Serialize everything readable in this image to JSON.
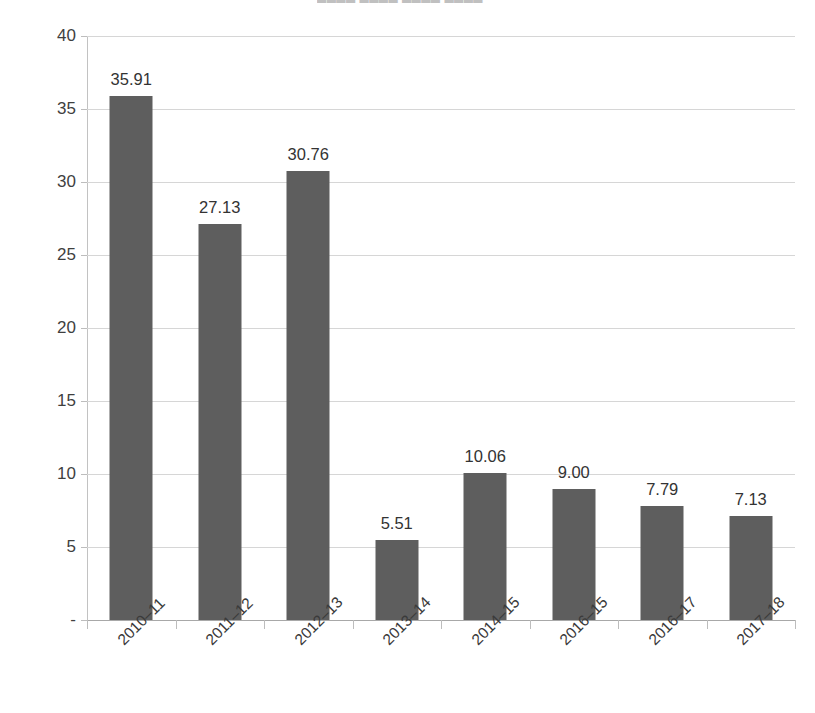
{
  "chart_data": {
    "type": "bar",
    "title": "",
    "xlabel": "",
    "ylabel": "",
    "categories": [
      "2010–11",
      "2011–12",
      "2012–13",
      "2013–14",
      "2014–15",
      "2016–15",
      "2016–17",
      "2017–18"
    ],
    "values": [
      35.91,
      27.13,
      30.76,
      5.51,
      10.06,
      9.0,
      7.79,
      7.13
    ],
    "value_labels": [
      "35.91",
      "27.13",
      "30.76",
      "5.51",
      "10.06",
      "9.00",
      "7.79",
      "7.13"
    ],
    "ylim": [
      0,
      40
    ],
    "ytick_values": [
      0,
      5,
      10,
      15,
      20,
      25,
      30,
      35,
      40
    ],
    "ytick_labels": [
      "-",
      "5",
      "10",
      "15",
      "20",
      "25",
      "30",
      "35",
      "40"
    ],
    "grid": true,
    "legend": false,
    "legend_position": "none",
    "bar_color": "#5e5e5e",
    "gridline_color": "#d6d6d6",
    "axis_color": "#bdbdbd",
    "text_color": "#3a3a3a",
    "background_color": "#ffffff",
    "xlabel_rotation": -45
  },
  "cropped_title": {
    "text": "████ ████ ████ ████",
    "visible": "partial-descenders-only"
  }
}
